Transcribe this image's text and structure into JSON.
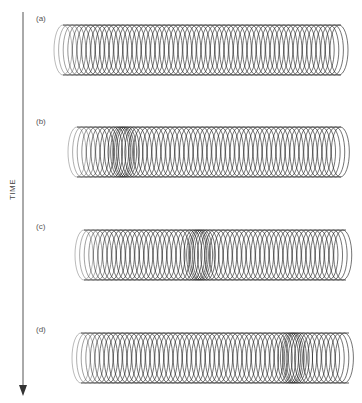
{
  "figure": {
    "axis_label": "TIME",
    "panels": [
      {
        "label": "(a)",
        "spring": {
          "x0": 54,
          "x1": 350,
          "top": 25,
          "bottom": 75,
          "compression_center": null
        }
      },
      {
        "label": "(b)",
        "spring": {
          "x0": 68,
          "x1": 350,
          "top": 127,
          "bottom": 177,
          "compression_center": 122
        }
      },
      {
        "label": "(c)",
        "spring": {
          "x0": 75,
          "x1": 355,
          "top": 230,
          "bottom": 280,
          "compression_center": 198
        }
      },
      {
        "label": "(d)",
        "spring": {
          "x0": 72,
          "x1": 358,
          "top": 333,
          "bottom": 383,
          "compression_center": 292
        }
      }
    ]
  }
}
